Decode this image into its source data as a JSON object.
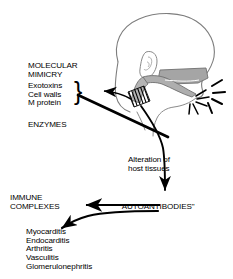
{
  "figure": {
    "background_color": "#ffffff",
    "ink_color": "#000000",
    "anatomy_shade_color": "#9a9a9a",
    "outline_color": "#7d7d7d"
  },
  "labels": {
    "molecular_mimicry": "MOLECULAR\nMIMICRY",
    "agent_list": "Exotoxins\nCell walls\nM protein",
    "brace": "}",
    "enzymes": "ENZYMES",
    "alteration": "Alteration of\nhost tissues",
    "immune_complexes": "IMMUNE\nCOMPLEXES",
    "autoantibodies": "\"AUTOANTIBODIES\"",
    "disease_list": "Myocarditis\nEndocarditis\nArthritis\nVasculitis\nGlomerulonephritis"
  },
  "anatomy": {
    "head_label": "human head in right-facing profile",
    "ear_label": "ear",
    "pharynx_label": "shaded pharynx and oral cavity",
    "infection_burst_label": "radiating inflammation lines at the throat",
    "hatched_band_label": "hatched band crossing the throat"
  },
  "arrows": {
    "to_mimicry": "arrow from throat pointing left to molecular mimicry list",
    "to_enzymes": "thick diagonal line from throat down-left past enzymes",
    "to_autoantibodies": "curved arrow from throat down to autoantibodies",
    "to_immune_complexes": "arrow from autoantibodies left to immune complexes",
    "to_diseases": "curved arrow from autoantibodies down-left to disease list"
  }
}
